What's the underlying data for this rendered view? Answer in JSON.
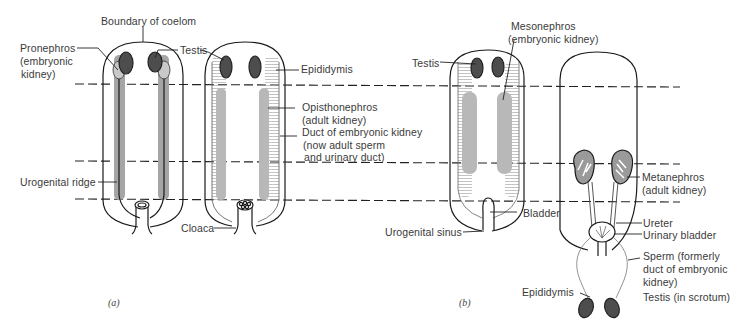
{
  "figure": {
    "panels": [
      {
        "id": "a",
        "caption": "(a)"
      },
      {
        "id": "b",
        "caption": "(b)"
      }
    ]
  },
  "labels": {
    "boundary_of_coelom": "Boundary of coelom",
    "pronephros_1": "Pronephros",
    "pronephros_2": "(embryonic",
    "pronephros_3": "kidney)",
    "testis_a": "Testis",
    "epididymis_a": "Epididymis",
    "opisthonephros_1": "Opisthonephros",
    "opisthonephros_2": "(adult kidney)",
    "duct_1": "Duct of embryonic kidney",
    "duct_2": "(now adult sperm",
    "duct_3": "and urinary duct)",
    "urogenital_ridge": "Urogenital ridge",
    "cloaca": "Cloaca",
    "mesonephros_1": "Mesonephros",
    "mesonephros_2": "(embryonic kidney)",
    "testis_b": "Testis",
    "bladder": "Bladder",
    "urogenital_sinus": "Urogenital sinus",
    "metanephros_1": "Metanephros",
    "metanephros_2": "(adult kidney)",
    "ureter": "Ureter",
    "urinary_bladder": "Urinary bladder",
    "sperm_1": "Sperm (formerly",
    "sperm_2": "duct of embryonic",
    "sperm_3": "kidney)",
    "epididymis_b": "Epididymis",
    "testis_scrotum": "Testis (in scrotum)"
  },
  "colors": {
    "outline": "#1a1a1a",
    "kidney_gray": "#a9a9a9",
    "kidney_light": "#c4c4c4",
    "testis_dark": "#4d4d4d",
    "text": "#3a3a3a"
  }
}
